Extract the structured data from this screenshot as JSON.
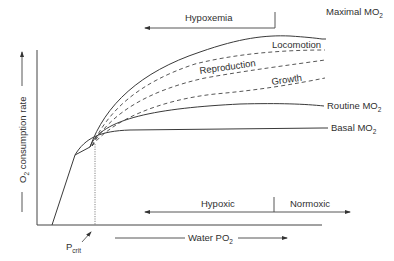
{
  "diagram": {
    "title": "",
    "axes": {
      "y_label": "O2 consumption rate",
      "y_label_main": "O",
      "y_label_sub": "2",
      "y_label_rest": " consumption rate",
      "x_label_main": "Water PO",
      "x_label_sub": "2",
      "pcrit_main": "P",
      "pcrit_sub": "crit"
    },
    "curves": {
      "maximal": {
        "main": "Maximal MO",
        "sub": "2"
      },
      "routine": {
        "main": "Routine MO",
        "sub": "2"
      },
      "basal": {
        "main": "Basal MO",
        "sub": "2"
      },
      "locomotion": "Locomotion",
      "reproduction": "Reproduction",
      "growth": "Growth"
    },
    "annotations": {
      "hypoxemia": "Hypoxemia",
      "hypoxic": "Hypoxic",
      "normoxic": "Normoxic"
    },
    "colors": {
      "line": "#3a3a3a",
      "background": "#ffffff"
    }
  }
}
